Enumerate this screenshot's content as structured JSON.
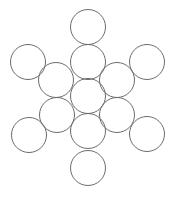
{
  "diagram": {
    "title": "",
    "background": "#ffffff",
    "stroke_color": "#6b6b6b",
    "stroke_width": 1,
    "radius": 17.5,
    "circles": [
      {
        "id": "top-outer",
        "cx": 88,
        "cy": 27
      },
      {
        "id": "top-inner",
        "cx": 88,
        "cy": 62
      },
      {
        "id": "upper-left-outer",
        "cx": 28,
        "cy": 62
      },
      {
        "id": "upper-right-outer",
        "cx": 147,
        "cy": 62
      },
      {
        "id": "upper-left-inner",
        "cx": 56,
        "cy": 80
      },
      {
        "id": "upper-right-inner",
        "cx": 117,
        "cy": 80
      },
      {
        "id": "center",
        "cx": 88,
        "cy": 96
      },
      {
        "id": "lower-left-inner",
        "cx": 57,
        "cy": 115
      },
      {
        "id": "lower-right-inner",
        "cx": 117,
        "cy": 115
      },
      {
        "id": "bottom-inner",
        "cx": 88,
        "cy": 131
      },
      {
        "id": "lower-left-outer",
        "cx": 29,
        "cy": 135
      },
      {
        "id": "lower-right-outer",
        "cx": 147,
        "cy": 134
      },
      {
        "id": "bottom-outer",
        "cx": 88,
        "cy": 168
      }
    ]
  }
}
